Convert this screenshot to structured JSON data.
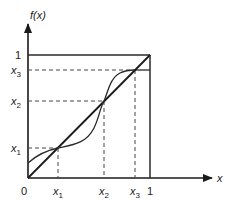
{
  "diagram": {
    "y_axis_label": "f(x)",
    "x_axis_label": "x",
    "origin_label": "0",
    "x_ticks": [
      {
        "base": "x",
        "sub": "1"
      },
      {
        "base": "x",
        "sub": "2"
      },
      {
        "base": "x",
        "sub": "3"
      },
      {
        "plain": "1"
      }
    ],
    "y_ticks": [
      {
        "plain": "1"
      },
      {
        "base": "x",
        "sub": "3"
      },
      {
        "base": "x",
        "sub": "2"
      },
      {
        "base": "x",
        "sub": "1"
      }
    ],
    "fixed_points": [
      "x1",
      "x2",
      "x3"
    ],
    "colors": {
      "line": "#2a2a2a",
      "dashed": "#444444"
    }
  }
}
